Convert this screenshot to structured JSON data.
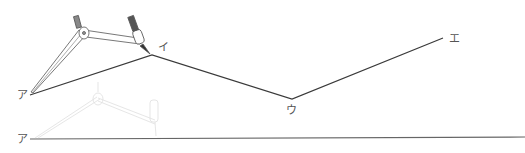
{
  "diagram": {
    "type": "compass-construction",
    "polyline": {
      "points": [
        {
          "label": "ア",
          "x": 30,
          "y": 95
        },
        {
          "label": "イ",
          "x": 152,
          "y": 55
        },
        {
          "label": "ウ",
          "x": 292,
          "y": 99
        },
        {
          "label": "エ",
          "x": 443,
          "y": 38
        }
      ],
      "color": "#333333"
    },
    "baseline": {
      "start_label": "ア",
      "x1": 30,
      "y1": 139,
      "x2": 525,
      "y2": 137,
      "color": "#555555"
    },
    "labels": {
      "a_top": "ア",
      "i": "イ",
      "u": "ウ",
      "e": "エ",
      "a_bottom": "ア"
    },
    "compass_top": {
      "opacity": 1.0,
      "description": "compass measuring ア to イ"
    },
    "compass_ghost": {
      "opacity": 0.2,
      "description": "faded compass on baseline"
    }
  }
}
